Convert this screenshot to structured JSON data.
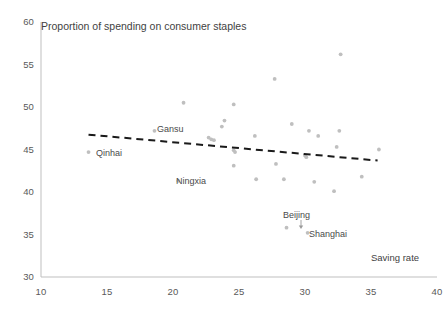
{
  "chart_data": {
    "type": "scatter",
    "title": "Proportion of spending on consumer staples",
    "xlabel": "Saving rate",
    "ylabel": "",
    "xlim": [
      10,
      40
    ],
    "ylim": [
      30,
      60
    ],
    "xticks": [
      10,
      15,
      20,
      25,
      30,
      35,
      40
    ],
    "yticks": [
      30,
      35,
      40,
      45,
      50,
      55,
      60
    ],
    "grid": false,
    "legend": null,
    "marker_color": "#bfbfbf",
    "axis_color": "#bfbfbf",
    "trendline": {
      "style": "dashed",
      "color": "#1a1a1a",
      "x": [
        13.6,
        35.5
      ],
      "y": [
        46.75,
        43.7
      ]
    },
    "points": [
      {
        "x": 13.6,
        "y": 44.7,
        "label": "Qinhai"
      },
      {
        "x": 18.6,
        "y": 47.2,
        "label": "Gansu"
      },
      {
        "x": 20.4,
        "y": 41.3,
        "label": "Ningxia"
      },
      {
        "x": 20.8,
        "y": 50.5,
        "label": null
      },
      {
        "x": 22.7,
        "y": 46.4,
        "label": null
      },
      {
        "x": 22.9,
        "y": 46.2,
        "label": null
      },
      {
        "x": 23.1,
        "y": 46.1,
        "label": null
      },
      {
        "x": 23.7,
        "y": 47.7,
        "label": null
      },
      {
        "x": 23.9,
        "y": 48.4,
        "label": null
      },
      {
        "x": 24.6,
        "y": 50.3,
        "label": null
      },
      {
        "x": 24.6,
        "y": 44.9,
        "label": null
      },
      {
        "x": 24.7,
        "y": 44.7,
        "label": null
      },
      {
        "x": 24.6,
        "y": 43.1,
        "label": null
      },
      {
        "x": 26.2,
        "y": 46.6,
        "label": null
      },
      {
        "x": 26.3,
        "y": 41.5,
        "label": null
      },
      {
        "x": 27.7,
        "y": 53.3,
        "label": null
      },
      {
        "x": 27.8,
        "y": 43.3,
        "label": null
      },
      {
        "x": 28.4,
        "y": 41.5,
        "label": null
      },
      {
        "x": 28.6,
        "y": 35.8,
        "label": null
      },
      {
        "x": 29.0,
        "y": 48.0,
        "label": null
      },
      {
        "x": 30.0,
        "y": 44.3,
        "label": null
      },
      {
        "x": 30.1,
        "y": 44.1,
        "label": null
      },
      {
        "x": 30.2,
        "y": 35.2,
        "label": "Shanghai"
      },
      {
        "x": 30.3,
        "y": 47.2,
        "label": null
      },
      {
        "x": 30.7,
        "y": 41.2,
        "label": null
      },
      {
        "x": 31.0,
        "y": 46.6,
        "label": null
      },
      {
        "x": 32.2,
        "y": 40.1,
        "label": null
      },
      {
        "x": 32.4,
        "y": 45.3,
        "label": null
      },
      {
        "x": 32.6,
        "y": 47.2,
        "label": null
      },
      {
        "x": 32.7,
        "y": 56.2,
        "label": null
      },
      {
        "x": 34.3,
        "y": 41.8,
        "label": null
      },
      {
        "x": 35.6,
        "y": 45.0,
        "label": null
      }
    ],
    "annotations": [
      {
        "name": "qinhai-label",
        "text": "Qinhai",
        "x": 96,
        "y": 148
      },
      {
        "name": "gansu-label",
        "text": "Gansu",
        "x": 157,
        "y": 124
      },
      {
        "name": "ningxia-label",
        "text": "Ningxia",
        "x": 176,
        "y": 176
      },
      {
        "name": "beijing-label",
        "text": "Beijing",
        "x": 283,
        "y": 210
      },
      {
        "name": "shanghai-label",
        "text": "Shanghai",
        "x": 309,
        "y": 229
      }
    ],
    "beijing_arrow": {
      "x": 301,
      "y1": 220,
      "y2": 229
    }
  }
}
